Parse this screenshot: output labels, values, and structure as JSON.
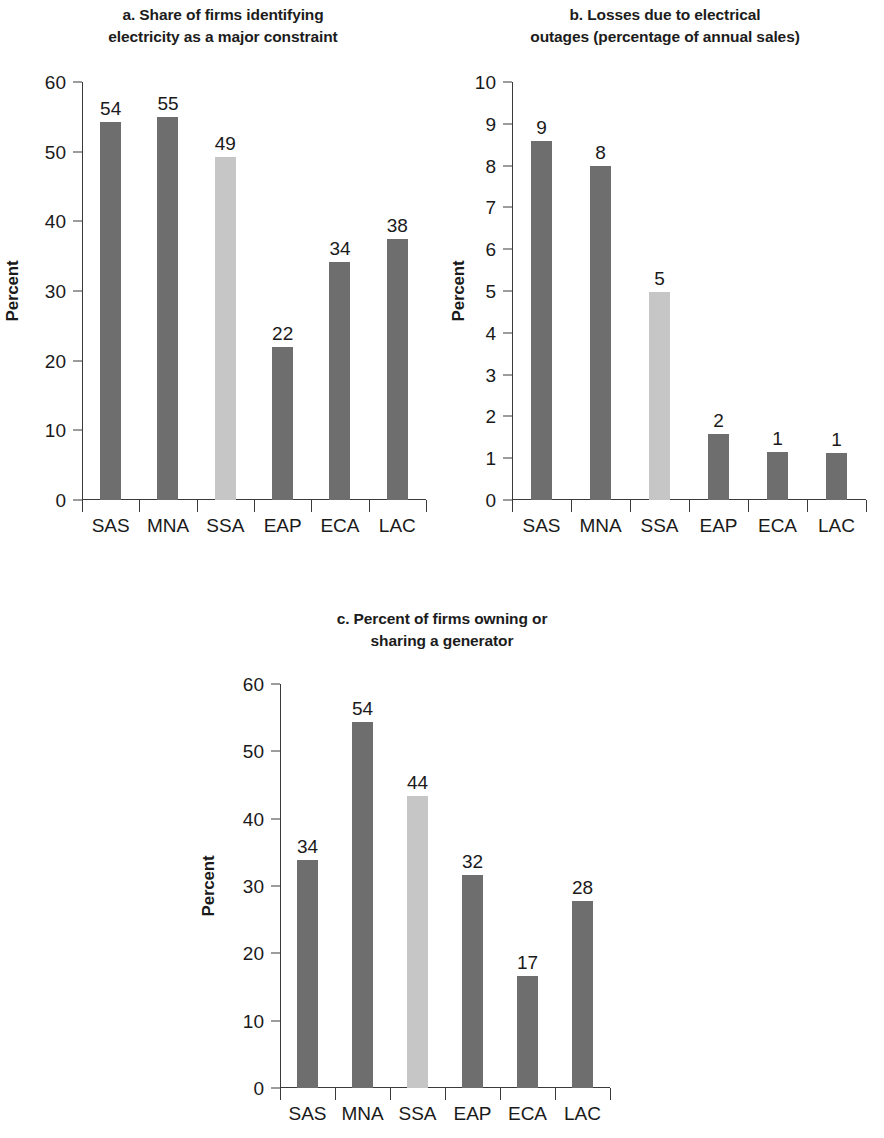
{
  "figure": {
    "categories": [
      "SAS",
      "MNA",
      "SSA",
      "EAP",
      "ECA",
      "LAC"
    ],
    "axis_label": "Percent",
    "colors": {
      "bar_default": "#6e6e6e",
      "bar_highlight": "#c6c6c6",
      "axis": "#3a3a3a",
      "text": "#1a1a1a",
      "background": "#ffffff"
    }
  },
  "chart_data": [
    {
      "type": "bar",
      "panel": "a",
      "title": "a. Share of firms identifying\nelectricity as a major constraint",
      "xlabel": "",
      "ylabel": "Percent",
      "categories": [
        "SAS",
        "MNA",
        "SSA",
        "EAP",
        "ECA",
        "LAC"
      ],
      "values": [
        54,
        55,
        49,
        22,
        34,
        38
      ],
      "bar_tops": [
        54.3,
        55.0,
        49.2,
        22.0,
        34.1,
        37.4
      ],
      "labels": [
        "54",
        "55",
        "49",
        "22",
        "34",
        "38"
      ],
      "highlight_category": "SSA",
      "ylim": [
        0,
        60
      ],
      "yticks": [
        0,
        10,
        20,
        30,
        40,
        50,
        60
      ],
      "ytick_labels": [
        "0",
        "10",
        "20",
        "30",
        "40",
        "50",
        "60"
      ],
      "grid": false,
      "legend": false
    },
    {
      "type": "bar",
      "panel": "b",
      "title": "b. Losses due to electrical\noutages (percentage of annual sales)",
      "xlabel": "",
      "ylabel": "Percent",
      "categories": [
        "SAS",
        "MNA",
        "SSA",
        "EAP",
        "ECA",
        "LAC"
      ],
      "values": [
        9,
        8,
        5,
        2,
        1,
        1
      ],
      "bar_tops": [
        8.6,
        8.0,
        4.97,
        1.57,
        1.15,
        1.13
      ],
      "labels": [
        "9",
        "8",
        "5",
        "2",
        "1",
        "1"
      ],
      "highlight_category": "SSA",
      "ylim": [
        0,
        10
      ],
      "yticks": [
        0,
        1,
        2,
        3,
        4,
        5,
        6,
        7,
        8,
        9,
        10
      ],
      "ytick_labels": [
        "0",
        "1",
        "2",
        "3",
        "4",
        "5",
        "6",
        "7",
        "8",
        "9",
        "10"
      ],
      "grid": false,
      "legend": false
    },
    {
      "type": "bar",
      "panel": "c",
      "title": "c. Percent of firms owning or\nsharing  a generator",
      "xlabel": "",
      "ylabel": "Percent",
      "categories": [
        "SAS",
        "MNA",
        "SSA",
        "EAP",
        "ECA",
        "LAC"
      ],
      "values": [
        34,
        54,
        44,
        32,
        17,
        28
      ],
      "bar_tops": [
        33.8,
        54.3,
        43.4,
        31.7,
        16.6,
        27.8
      ],
      "labels": [
        "34",
        "54",
        "44",
        "32",
        "17",
        "28"
      ],
      "highlight_category": "SSA",
      "ylim": [
        0,
        60
      ],
      "yticks": [
        0,
        10,
        20,
        30,
        40,
        50,
        60
      ],
      "ytick_labels": [
        "0",
        "10",
        "20",
        "30",
        "40",
        "50",
        "60"
      ],
      "grid": false,
      "legend": false
    }
  ]
}
